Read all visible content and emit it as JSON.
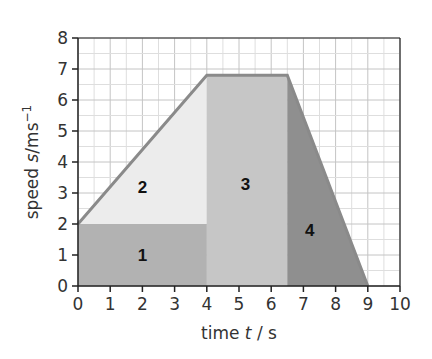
{
  "chart_data": {
    "type": "area",
    "title": "",
    "xlabel": "time t / s",
    "xlabel_parts": {
      "pre": "time ",
      "var": "t",
      "post": " / s"
    },
    "ylabel": "speed s/ms⁻¹",
    "ylabel_parts": {
      "pre": "speed ",
      "var": "s",
      "post": "/ms",
      "sup": "−1"
    },
    "xlim": [
      0,
      10
    ],
    "ylim": [
      0,
      8
    ],
    "x_ticks": [
      0,
      1,
      2,
      3,
      4,
      5,
      6,
      7,
      8,
      9,
      10
    ],
    "y_ticks": [
      0,
      1,
      2,
      3,
      4,
      5,
      6,
      7,
      8
    ],
    "grid": true,
    "grid_minor_step": 0.5,
    "legend": null,
    "speed_time_graph": {
      "x": [
        0,
        4,
        6.5,
        9
      ],
      "y": [
        2,
        6.8,
        6.8,
        0
      ]
    },
    "regions": [
      {
        "label": "1",
        "shape": "rectangle",
        "points": [
          [
            0,
            0
          ],
          [
            4,
            0
          ],
          [
            4,
            2
          ],
          [
            0,
            2
          ]
        ],
        "label_pos": [
          2,
          1
        ],
        "color": "#b2b2b2"
      },
      {
        "label": "2",
        "shape": "triangle",
        "points": [
          [
            0,
            2
          ],
          [
            4,
            2
          ],
          [
            4,
            6.8
          ]
        ],
        "label_pos": [
          2,
          3.2
        ],
        "color": "#ececec"
      },
      {
        "label": "3",
        "shape": "rectangle",
        "points": [
          [
            4,
            0
          ],
          [
            6.5,
            0
          ],
          [
            6.5,
            6.8
          ],
          [
            4,
            6.8
          ]
        ],
        "label_pos": [
          5.2,
          3.3
        ],
        "color": "#c6c6c6"
      },
      {
        "label": "4",
        "shape": "triangle",
        "points": [
          [
            6.5,
            0
          ],
          [
            9,
            0
          ],
          [
            6.5,
            6.8
          ]
        ],
        "label_pos": [
          7.2,
          1.8
        ],
        "color": "#8f8f8f"
      }
    ],
    "outline_color": "#8a8a8a"
  }
}
